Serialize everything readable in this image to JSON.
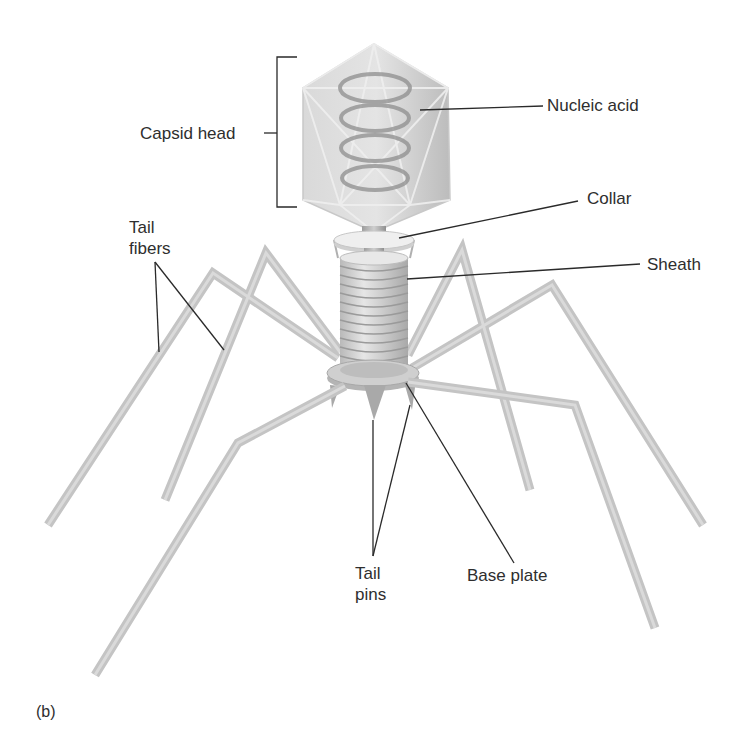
{
  "figure": {
    "panel_label": "(b)",
    "labels": {
      "capsid_head": "Capsid head",
      "nucleic_acid": "Nucleic acid",
      "collar": "Collar",
      "sheath": "Sheath",
      "tail_fibers_line1": "Tail",
      "tail_fibers_line2": "fibers",
      "tail_pins_line1": "Tail",
      "tail_pins_line2": "pins",
      "base_plate": "Base plate"
    },
    "colors": {
      "background": "#ffffff",
      "structure": "#c4c4c4",
      "capsid": "#cfcfcf",
      "leader_lines": "#2a2a2a",
      "text": "#2e2e2e"
    }
  }
}
